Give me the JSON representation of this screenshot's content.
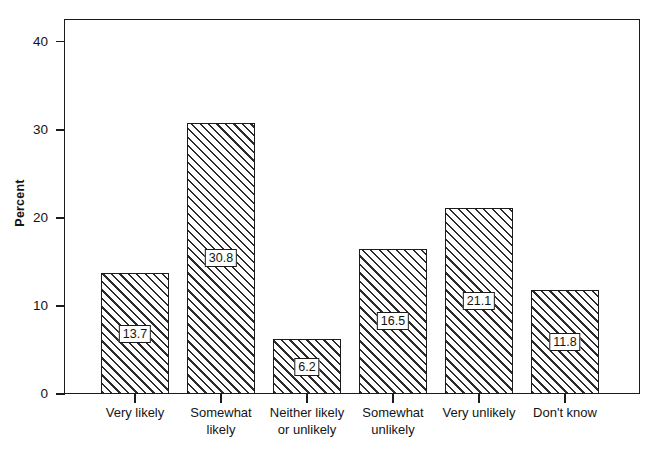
{
  "chart_data": {
    "type": "bar",
    "title": "",
    "xlabel": "",
    "ylabel": "Percent",
    "categories": [
      "Very likely",
      "Somewhat likely",
      "Neither likely or unlikely",
      "Somewhat unlikely",
      "Very unlikely",
      "Don't know"
    ],
    "category_lines": [
      [
        "Very likely"
      ],
      [
        "Somewhat",
        "likely"
      ],
      [
        "Neither likely",
        "or unlikely"
      ],
      [
        "Somewhat",
        "unlikely"
      ],
      [
        "Very unlikely"
      ],
      [
        "Don't know"
      ]
    ],
    "values": [
      13.7,
      30.8,
      6.2,
      16.5,
      21.1,
      11.8
    ],
    "value_labels": [
      "13.7",
      "30.8",
      "6.2",
      "16.5",
      "21.1",
      "11.8"
    ],
    "ylim": [
      0,
      42.6
    ],
    "yticks": [
      0,
      10,
      20,
      30,
      40
    ],
    "ytick_labels": [
      "0",
      "10",
      "20",
      "30",
      "40"
    ],
    "grid": false,
    "legend": null,
    "bar_fill": "diagonal-hatch",
    "colors": {
      "axis": "#1b1b1b",
      "hatch": "#2b2b2b",
      "background": "#ffffff",
      "text": "#141414"
    }
  }
}
